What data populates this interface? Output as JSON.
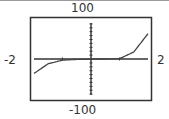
{
  "chart_data": {
    "type": "line",
    "title": "",
    "xlabel": "",
    "ylabel": "",
    "xlim": [
      -2,
      2
    ],
    "ylim": [
      -100,
      100
    ],
    "window_labels": {
      "ymax": "100",
      "ymin": "-100",
      "xmin": "-2",
      "xmax": "2"
    },
    "grid": false,
    "axes": {
      "y_ticks_step": 10,
      "x_ticks_step": 1
    },
    "series": [
      {
        "name": "f(x)",
        "x": [
          -2,
          -1.5,
          -1,
          -0.5,
          0,
          0.5,
          1,
          1.5,
          2
        ],
        "y": [
          -37,
          -12,
          -3,
          -1,
          0,
          0,
          1,
          18,
          65
        ]
      }
    ]
  },
  "colors": {
    "frame": "#333333",
    "curve": "#444444",
    "axis": "#333333"
  }
}
